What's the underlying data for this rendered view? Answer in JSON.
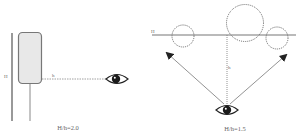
{
  "left_diagram": {
    "wall_label": "H",
    "distance_label": "h",
    "ratio_caption": "H/h=2.0",
    "eye_icon": "eye-icon"
  },
  "right_diagram": {
    "line_label": "H",
    "distance_label": "h",
    "ratio_caption": "H/h=1.5",
    "eye_icon": "eye-icon"
  },
  "colors": {
    "stroke": "#777777",
    "panel_fill": "#e6e6e6",
    "eye": "#1a1a1a"
  }
}
